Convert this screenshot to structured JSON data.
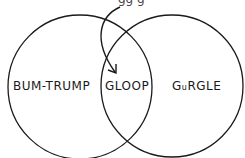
{
  "diagram": {
    "type": "venn",
    "top_caption_partial": "gg g",
    "circles": [
      {
        "id": "left",
        "label": "BUM-TRUMP"
      },
      {
        "id": "right",
        "label_prefix": "G",
        "label_small": "u",
        "label_suffix": "RGLE"
      }
    ],
    "intersection": {
      "label": "GLOOP"
    },
    "arrow": {
      "points_to": "intersection"
    },
    "stroke_color": "#1a1a1a",
    "background": "#ffffff"
  }
}
